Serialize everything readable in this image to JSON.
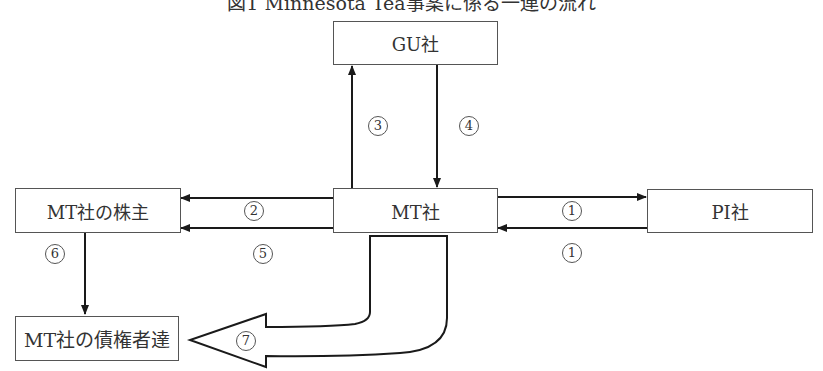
{
  "title": "図1 Minnesota Tea事案に係る一連の流れ",
  "nodes": {
    "gu": "GU社",
    "mt": "MT社",
    "pi": "PI社",
    "shareholders": "MT社の株主",
    "creditors": "MT社の債権者達"
  },
  "edges": [
    {
      "id": "1a",
      "label": "1",
      "from": "mt",
      "to": "pi"
    },
    {
      "id": "1b",
      "label": "1",
      "from": "pi",
      "to": "mt"
    },
    {
      "id": "2",
      "label": "2",
      "from": "mt",
      "to": "shareholders"
    },
    {
      "id": "3",
      "label": "3",
      "from": "mt",
      "to": "gu"
    },
    {
      "id": "4",
      "label": "4",
      "from": "gu",
      "to": "mt"
    },
    {
      "id": "5",
      "label": "5",
      "from": "mt",
      "to": "shareholders"
    },
    {
      "id": "6",
      "label": "6",
      "from": "shareholders",
      "to": "creditors"
    },
    {
      "id": "7",
      "label": "7",
      "from": "mt",
      "to": "creditors",
      "style": "block-arrow"
    }
  ],
  "colors": {
    "line": "#1a1a1a",
    "box_border": "#555555"
  }
}
